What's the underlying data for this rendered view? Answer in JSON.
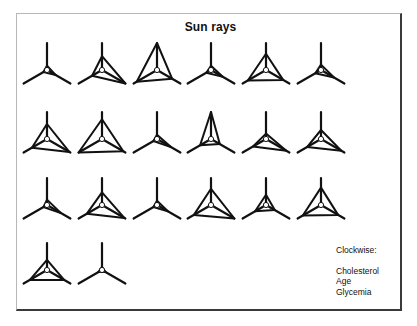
{
  "chart_data": {
    "type": "star-glyph",
    "title": "Sun rays",
    "variables": [
      "Cholesterol",
      "Age",
      "Glycemia"
    ],
    "direction": "clockwise",
    "layout": {
      "columns": 6,
      "rows": 4,
      "col_x": [
        47,
        102,
        157,
        211,
        266,
        321
      ],
      "row_y": [
        70,
        139,
        205,
        270
      ],
      "ray_length": 27
    },
    "glyphs": [
      {
        "id": 1,
        "values": [
          0.05,
          0.3,
          0.05
        ]
      },
      {
        "id": 2,
        "values": [
          0.45,
          1.0,
          0.35
        ]
      },
      {
        "id": 3,
        "values": [
          1.0,
          0.6,
          0.85
        ]
      },
      {
        "id": 4,
        "values": [
          0.05,
          0.45,
          0.1
        ]
      },
      {
        "id": 5,
        "values": [
          0.55,
          0.7,
          0.75
        ]
      },
      {
        "id": 6,
        "values": [
          0.1,
          0.5,
          0.15
        ]
      },
      {
        "id": 7,
        "values": [
          0.5,
          0.95,
          0.6
        ]
      },
      {
        "id": 8,
        "values": [
          0.7,
          0.9,
          1.0
        ]
      },
      {
        "id": 9,
        "values": [
          0.05,
          0.55,
          0.05
        ]
      },
      {
        "id": 10,
        "values": [
          1.0,
          0.3,
          0.4
        ]
      },
      {
        "id": 11,
        "values": [
          0.1,
          0.85,
          0.5
        ]
      },
      {
        "id": 12,
        "values": [
          0.25,
          0.85,
          0.55
        ]
      },
      {
        "id": 13,
        "values": [
          0.1,
          0.55,
          0.05
        ]
      },
      {
        "id": 14,
        "values": [
          0.4,
          0.95,
          0.6
        ]
      },
      {
        "id": 15,
        "values": [
          0.05,
          0.4,
          0.05
        ]
      },
      {
        "id": 16,
        "values": [
          0.55,
          1.0,
          0.7
        ]
      },
      {
        "id": 17,
        "values": [
          0.3,
          0.3,
          0.4
        ]
      },
      {
        "id": 18,
        "values": [
          0.6,
          0.7,
          0.75
        ]
      },
      {
        "id": 19,
        "values": [
          0.3,
          0.7,
          0.7
        ]
      },
      {
        "id": 20,
        "values": [
          0.0,
          0.05,
          0.05
        ]
      }
    ],
    "legend_position": "bottom-right"
  },
  "legend": {
    "header": "Clockwise:",
    "items": [
      "Cholesterol",
      "Age",
      "Glycemia"
    ]
  },
  "colors": {
    "line": "#111111",
    "frame_dark": "#3a3a3a",
    "frame_light": "#b8b8b8"
  }
}
